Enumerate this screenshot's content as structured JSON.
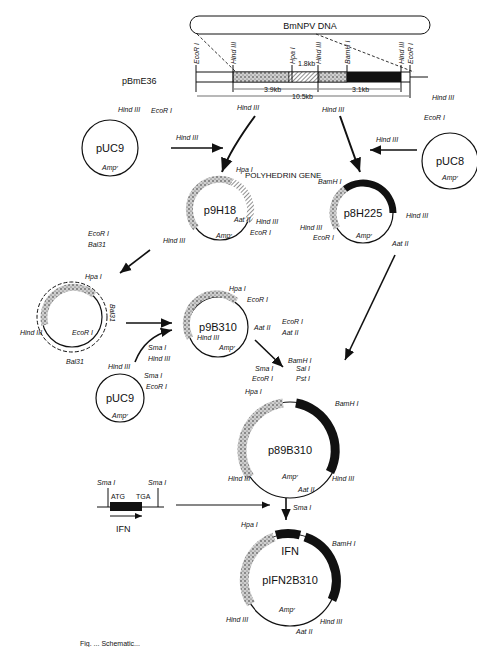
{
  "figure": {
    "caption_partial": "Fig. ... Schematic...",
    "genome": {
      "title": "BmNPV DNA",
      "clone": "pBmE36",
      "sites": [
        "EcoR I",
        "Hind III",
        "Hpa I",
        "Hind III",
        "BamH I",
        "Hind III",
        "EcoR I"
      ],
      "fragments": [
        "1.8kb",
        "3.9kb",
        "3.1kb",
        "10.5kb"
      ]
    },
    "plasmids": {
      "pUC9_a": {
        "name": "pUC9",
        "sites": [
          "Hind III",
          "EcoR I"
        ],
        "marker": "Ampʳ"
      },
      "pUC8": {
        "name": "pUC8",
        "sites": [
          "EcoR I"
        ],
        "marker": "Ampʳ"
      },
      "p9H18": {
        "name": "p9H18",
        "sites": [
          "Hpa I",
          "Hind III",
          "EcoR I",
          "Aat II",
          "Hind III"
        ],
        "marker": "Ampʳ",
        "gene": "POLYHEDRIN GENE"
      },
      "p8H225": {
        "name": "p8H225",
        "sites": [
          "BamH I",
          "Hind III",
          "Hind III",
          "EcoR I",
          "Aat II"
        ],
        "marker": "Ampʳ"
      },
      "deletion": {
        "sites": [
          "Hpa I",
          "Hind III",
          "EcoR I"
        ],
        "enzyme": "Bal31"
      },
      "p9B310": {
        "name": "p9B310",
        "sites": [
          "Hpa I",
          "EcoR I",
          "Aat II",
          "Hind III"
        ],
        "marker": "Ampʳ"
      },
      "pUC9_b": {
        "name": "pUC9",
        "sites": [
          "Hind III",
          "Sma I",
          "EcoR I"
        ],
        "marker": "Ampʳ"
      },
      "p89B310": {
        "name": "p89B310",
        "sites": [
          "Sma I",
          "BamH I",
          "Sal I",
          "EcoR I",
          "Pst I",
          "Hpa I",
          "BamH I",
          "Hind III",
          "Hind III",
          "Aat II"
        ],
        "marker": "Ampʳ"
      },
      "pIFN2B310": {
        "name": "pIFN2B310",
        "sites": [
          "Hpa I",
          "BamH I",
          "Hind III",
          "Hind III",
          "Aat II"
        ],
        "marker": "Ampʳ",
        "insert": "IFN"
      }
    },
    "steps": {
      "s1": "Hind III",
      "s2": "Hind III",
      "s3": "Hind III",
      "s4": "Hind III",
      "s5": "Hind III",
      "s6a": "EcoR I",
      "s6b": "Bal31",
      "s7a": "Sma I",
      "s7b": "Hind III",
      "s8a": "EcoR I",
      "s8b": "Aat II",
      "s9": "Sma I"
    },
    "ifn_gene": {
      "site_left": "Sma I",
      "site_right": "Sma I",
      "start": "ATG",
      "stop": "TGA",
      "label": "IFN"
    }
  }
}
